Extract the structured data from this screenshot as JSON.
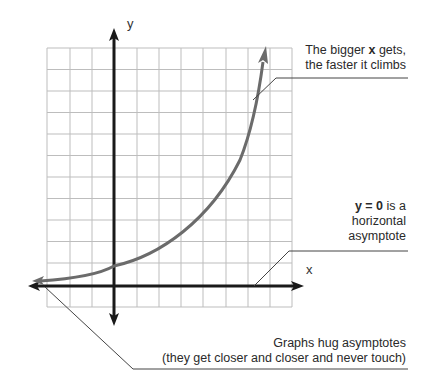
{
  "axes": {
    "x_label": "x",
    "y_label": "y"
  },
  "annotations": {
    "growth": {
      "line1_pre": "The bigger ",
      "line1_bold": "x",
      "line1_post": " gets,",
      "line2": "the faster it climbs"
    },
    "asymptote": {
      "bold": "y = 0",
      "line1_post": " is a",
      "line2": "horizontal",
      "line3": "asymptote"
    },
    "hug": {
      "line1": "Graphs hug asymptotes",
      "line2": "(they get closer and closer and never touch)"
    }
  },
  "colors": {
    "curve": "#6b6b6b",
    "axis": "#1a1a1a",
    "grid": "#bdbdbd",
    "leader": "#444444"
  }
}
